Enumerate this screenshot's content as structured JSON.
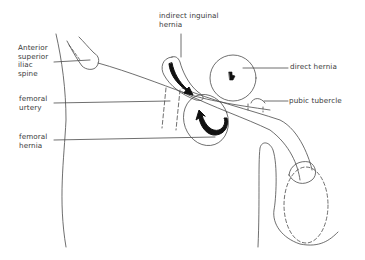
{
  "diagram": {
    "colors": {
      "line": "#4a4a4a",
      "fill": "#111111",
      "background": "#ffffff",
      "text": "#3a3a3a"
    },
    "labels": {
      "asis": "Anterior\nsuperior\niliac\nspine",
      "femoral_artery": "femoral\nurtery",
      "femoral_hernia": "femoral\nhernia",
      "indirect": "indirect inguinal\nhernia",
      "direct": "direct hernia",
      "pubic_tubercle": "pubic tubercle"
    },
    "structures": [
      "anterior-superior-iliac-spine",
      "inguinal-ligament",
      "femoral-artery",
      "indirect-inguinal-hernia",
      "direct-hernia",
      "femoral-hernia",
      "pubic-tubercle",
      "penis",
      "scrotum",
      "thigh-outline"
    ],
    "arrows": [
      {
        "sac": "indirect-inguinal-hernia",
        "icon": "curved-arrow-icon"
      },
      {
        "sac": "direct-hernia",
        "icon": "arrow-icon"
      },
      {
        "sac": "femoral-hernia",
        "icon": "curved-arrow-icon"
      }
    ]
  }
}
